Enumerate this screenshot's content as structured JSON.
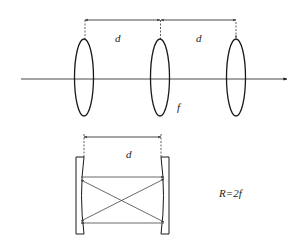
{
  "diagram": {
    "top": {
      "title": "Lens waveguide with equally spaced thin lenses",
      "labels": {
        "spacing_1": "d",
        "spacing_2": "d",
        "focal_length": "f"
      },
      "lens_count": 3
    },
    "bottom": {
      "title": "Equivalent two-mirror resonator",
      "labels": {
        "spacing": "d",
        "radius_relation": "R=2f"
      }
    },
    "colors": {
      "stroke": "#1a1a1a",
      "ray": "#555555",
      "background": "#ffffff"
    }
  }
}
